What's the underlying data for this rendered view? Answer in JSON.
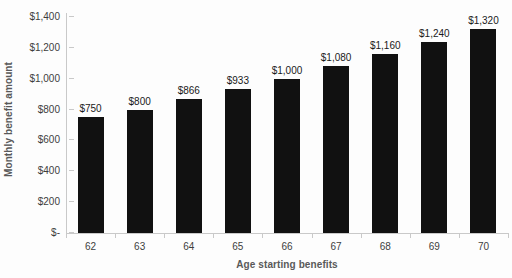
{
  "chart_data": {
    "type": "bar",
    "title": "",
    "xlabel": "Age starting benefits",
    "ylabel": "Monthly benefit amount",
    "categories": [
      "62",
      "63",
      "64",
      "65",
      "66",
      "67",
      "68",
      "69",
      "70"
    ],
    "values": [
      750,
      800,
      866,
      933,
      1000,
      1080,
      1160,
      1240,
      1320
    ],
    "data_labels": [
      "$750",
      "$800",
      "$866",
      "$933",
      "$1,000",
      "$1,080",
      "$1,160",
      "$1,240",
      "$1,320"
    ],
    "ylim": [
      0,
      1400
    ],
    "ytick_values": [
      1400,
      1200,
      1000,
      800,
      600,
      400,
      200,
      0
    ],
    "ytick_labels": [
      "$1,400",
      "$1,200",
      "$1,000",
      "$800",
      "$600",
      "$400",
      "$200",
      "$-"
    ],
    "grid": false,
    "legend": null,
    "bar_color": "#111111",
    "axis_color": "#c9c9c9",
    "text_color": "#3d3d3d",
    "title_color": "#595959",
    "background_color": "#fdfdfd"
  }
}
